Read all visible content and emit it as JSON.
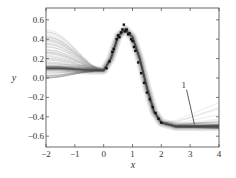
{
  "chart_data": {
    "type": "line",
    "title": "",
    "xlabel": "x",
    "ylabel": "y",
    "xlim": [
      -2,
      4
    ],
    "ylim": [
      -0.72,
      0.72
    ],
    "xticks": [
      -2,
      -1,
      0,
      1,
      2,
      3,
      4
    ],
    "yticks": [
      0.6,
      0.4,
      0.2,
      0.0,
      -0.2,
      -0.4,
      -0.6
    ],
    "xtick_labels": [
      "−2",
      "−1",
      "0",
      "1",
      "2",
      "3",
      "4"
    ],
    "ytick_labels": [
      "0.6",
      "0.4",
      "0.2",
      "0.0",
      "−0.2",
      "−0.4",
      "−0.6"
    ],
    "grid": false,
    "annotation": {
      "text": "1",
      "x_text": 2.7,
      "y_text": -0.1,
      "x_tip": 3.15,
      "y_tip": -0.48
    },
    "mean_curve": {
      "x": [
        -2,
        -1.5,
        -1,
        -0.5,
        0,
        0.25,
        0.5,
        0.75,
        1.0,
        1.25,
        1.5,
        1.75,
        2.0,
        2.5,
        3,
        3.5,
        4
      ],
      "y": [
        0.1,
        0.1,
        0.09,
        0.08,
        0.08,
        0.2,
        0.43,
        0.5,
        0.42,
        0.2,
        -0.1,
        -0.35,
        -0.46,
        -0.5,
        -0.5,
        -0.5,
        -0.5
      ]
    },
    "sample_curves_left_start_range": [
      0.0,
      0.5
    ],
    "observations": {
      "x": [
        0.1,
        0.2,
        0.3,
        0.35,
        0.45,
        0.5,
        0.55,
        0.6,
        0.65,
        0.7,
        0.75,
        0.8,
        0.85,
        0.9,
        0.95,
        1.0,
        1.05,
        1.1,
        1.2,
        1.3,
        1.4,
        1.5,
        1.6,
        1.7,
        1.8,
        1.9,
        2.0
      ],
      "y": [
        0.1,
        0.17,
        0.27,
        0.3,
        0.4,
        0.44,
        0.42,
        0.47,
        0.5,
        0.55,
        0.48,
        0.5,
        0.45,
        0.46,
        0.4,
        0.38,
        0.32,
        0.28,
        0.16,
        0.05,
        -0.05,
        -0.15,
        -0.22,
        -0.3,
        -0.36,
        -0.42,
        -0.46
      ]
    }
  }
}
